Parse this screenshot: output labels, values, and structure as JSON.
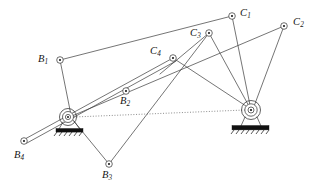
{
  "figure": {
    "background_color": "#ffffff",
    "line_color": "#3a3a3a",
    "dotted_line_color": "#5a5a5a",
    "ground_color": "#111111",
    "width": 324,
    "height": 195
  },
  "nodes": [
    {
      "id": "B1",
      "letter": "B",
      "subscript": "1",
      "label": "B₁",
      "x": 60,
      "y": 60,
      "label_x": 38,
      "label_y": 54,
      "type": "revolute-joint"
    },
    {
      "id": "B2",
      "letter": "B",
      "subscript": "2",
      "label": "B₂",
      "x": 126,
      "y": 91,
      "label_x": 120,
      "label_y": 97,
      "type": "revolute-joint"
    },
    {
      "id": "B3",
      "letter": "B",
      "subscript": "3",
      "label": "B₃",
      "x": 109,
      "y": 164,
      "label_x": 102,
      "label_y": 170,
      "type": "revolute-joint"
    },
    {
      "id": "B4",
      "letter": "B",
      "subscript": "4",
      "label": "B₄",
      "x": 24,
      "y": 141,
      "label_x": 14,
      "label_y": 150,
      "type": "revolute-joint"
    },
    {
      "id": "C1",
      "letter": "C",
      "subscript": "1",
      "label": "C₁",
      "x": 232,
      "y": 16,
      "label_x": 240,
      "label_y": 8,
      "type": "revolute-joint"
    },
    {
      "id": "C2",
      "letter": "C",
      "subscript": "2",
      "label": "C₂",
      "x": 284,
      "y": 26,
      "label_x": 293,
      "label_y": 17,
      "type": "revolute-joint"
    },
    {
      "id": "C3",
      "letter": "C",
      "subscript": "3",
      "label": "C₃",
      "x": 209,
      "y": 33,
      "label_x": 190,
      "label_y": 29,
      "type": "revolute-joint"
    },
    {
      "id": "C4",
      "letter": "C",
      "subscript": "4",
      "label": "C₄",
      "x": 173,
      "y": 58,
      "label_x": 152,
      "label_y": 48,
      "type": "revolute-joint"
    }
  ],
  "ground_pivots": [
    {
      "id": "A0",
      "name": "left-ground-pivot",
      "x": 68,
      "y": 117,
      "base_x": 57,
      "base_y": 128,
      "base_w": 26,
      "base_h": 4
    },
    {
      "id": "B0",
      "name": "right-ground-pivot",
      "x": 251,
      "y": 110,
      "base_x": 233,
      "base_y": 126,
      "base_w": 36,
      "base_h": 5
    }
  ],
  "links": [
    {
      "name": "B1-to-C1",
      "from": "B1",
      "to": "C1"
    },
    {
      "name": "B1-to-left-pivot",
      "from": "B1",
      "to": "A0"
    },
    {
      "name": "C1-to-right-pivot",
      "from": "C1",
      "to": "B0"
    },
    {
      "name": "C2-to-right-pivot",
      "from": "C2",
      "to": "B0"
    },
    {
      "name": "C3-to-right-pivot",
      "from": "C3",
      "to": "B0"
    },
    {
      "name": "C4-to-right-pivot",
      "from": "C4",
      "to": "B0"
    },
    {
      "name": "C3-to-C4-cross",
      "from": "C3",
      "to": "C4"
    },
    {
      "name": "B2-to-C4-line",
      "from": "A0",
      "to": "C4"
    },
    {
      "name": "B2-link-upper",
      "from": "B4",
      "to": "C4"
    },
    {
      "name": "B3-to-left-pivot",
      "from": "B3",
      "to": "A0"
    },
    {
      "name": "B3-to-C3",
      "from": "B3",
      "to": "C3"
    },
    {
      "name": "B4-to-left-pivot",
      "from": "B4",
      "to": "A0"
    },
    {
      "name": "C2-to-left-crossing",
      "from": "C2",
      "to": "A0"
    }
  ],
  "dotted_reference_line": {
    "name": "frame-reference-line",
    "from": "A0",
    "to": "B0",
    "x1": 72,
    "y1": 117,
    "x2": 246,
    "y2": 110
  }
}
